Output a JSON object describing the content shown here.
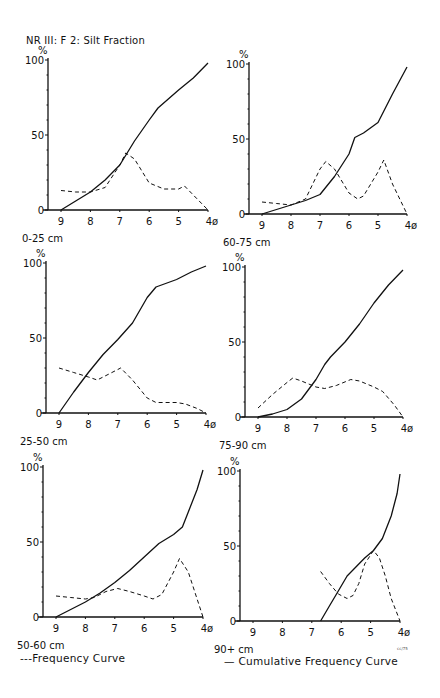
{
  "figure": {
    "title": "NR III: F 2: Silt Fraction",
    "legend": {
      "frequency": "---Frequency Curve",
      "cumulative": "— Cumulative Frequency Curve"
    },
    "corner_mark": "cc/75"
  },
  "chart_data": [
    {
      "type": "line",
      "title": "0-25 cm",
      "xlabel": "φ",
      "ylabel": "%",
      "x_ticks": [
        "9",
        "8",
        "7",
        "6",
        "5",
        "4ø"
      ],
      "y_ticks": [
        "0",
        "50",
        "100"
      ],
      "xlim": [
        9.4,
        4
      ],
      "ylim": [
        0,
        100
      ],
      "series": [
        {
          "name": "Cumulative Frequency Curve",
          "style": "solid",
          "x": [
            9,
            8.5,
            8,
            7.5,
            7,
            6.5,
            6,
            5.7,
            5,
            4.5,
            4
          ],
          "y": [
            0,
            6,
            12,
            20,
            30,
            46,
            60,
            68,
            80,
            88,
            98
          ]
        },
        {
          "name": "Frequency Curve",
          "style": "dashed",
          "x": [
            9,
            8.5,
            8,
            7.5,
            7,
            6.8,
            6.5,
            6,
            5.5,
            5,
            4.8,
            4.5,
            4
          ],
          "y": [
            13,
            12,
            12,
            15,
            30,
            38,
            34,
            18,
            14,
            14,
            16,
            10,
            0
          ]
        }
      ]
    },
    {
      "type": "line",
      "title": "60-75 cm",
      "xlabel": "φ",
      "ylabel": "%",
      "x_ticks": [
        "9",
        "8",
        "7",
        "6",
        "5",
        "4ø"
      ],
      "y_ticks": [
        "0",
        "50",
        "100"
      ],
      "xlim": [
        9.4,
        4
      ],
      "ylim": [
        0,
        100
      ],
      "series": [
        {
          "name": "Cumulative Frequency Curve",
          "style": "solid",
          "x": [
            9,
            8.5,
            8,
            7.5,
            7,
            6.5,
            6,
            5.8,
            5.5,
            5,
            4.5,
            4
          ],
          "y": [
            0,
            3,
            6,
            9,
            13,
            25,
            40,
            51,
            54,
            61,
            80,
            98
          ]
        },
        {
          "name": "Frequency Curve",
          "style": "dashed",
          "x": [
            9,
            8.5,
            8,
            7.5,
            7,
            6.8,
            6.5,
            6,
            5.7,
            5.5,
            5,
            4.8,
            4.5,
            4
          ],
          "y": [
            8,
            7,
            6,
            10,
            30,
            35,
            30,
            14,
            10,
            12,
            28,
            36,
            20,
            0
          ]
        }
      ]
    },
    {
      "type": "line",
      "title": "25-50 cm",
      "xlabel": "φ",
      "ylabel": "%",
      "x_ticks": [
        "9",
        "8",
        "7",
        "6",
        "5",
        "4ø"
      ],
      "y_ticks": [
        "0",
        "50",
        "100"
      ],
      "xlim": [
        9.4,
        4
      ],
      "ylim": [
        0,
        100
      ],
      "series": [
        {
          "name": "Cumulative Frequency Curve",
          "style": "solid",
          "x": [
            9,
            8.5,
            8,
            7.5,
            7,
            6.5,
            6,
            5.7,
            5,
            4.5,
            4
          ],
          "y": [
            0,
            14,
            27,
            39,
            49,
            60,
            77,
            84,
            89,
            94,
            98
          ]
        },
        {
          "name": "Frequency Curve",
          "style": "dashed",
          "x": [
            9,
            8.5,
            8,
            7.7,
            7.3,
            6.9,
            6.5,
            6,
            5.7,
            5,
            4.7,
            4.3,
            4
          ],
          "y": [
            30,
            27,
            24,
            22,
            26,
            30,
            22,
            10,
            7,
            7,
            6,
            3,
            0
          ]
        }
      ]
    },
    {
      "type": "line",
      "title": "75-90 cm",
      "xlabel": "φ",
      "ylabel": "%",
      "x_ticks": [
        "9",
        "8",
        "7",
        "6",
        "5",
        "4ø"
      ],
      "y_ticks": [
        "0",
        "50",
        "100"
      ],
      "xlim": [
        9.4,
        4
      ],
      "ylim": [
        0,
        100
      ],
      "series": [
        {
          "name": "Cumulative Frequency Curve",
          "style": "solid",
          "x": [
            9,
            8.5,
            8,
            7.5,
            7,
            6.7,
            6.5,
            6,
            5.5,
            5,
            4.5,
            4
          ],
          "y": [
            0,
            2,
            5,
            12,
            25,
            35,
            40,
            50,
            62,
            76,
            88,
            98
          ]
        },
        {
          "name": "Frequency Curve",
          "style": "dashed",
          "x": [
            9,
            8.5,
            8,
            7.8,
            7.5,
            7,
            6.7,
            6.3,
            5.8,
            5.5,
            5,
            4.7,
            4.3,
            4
          ],
          "y": [
            6,
            15,
            23,
            26,
            24,
            20,
            19,
            21,
            25,
            24,
            20,
            17,
            8,
            0
          ]
        }
      ]
    },
    {
      "type": "line",
      "title": "50-60 cm",
      "xlabel": "φ",
      "ylabel": "%",
      "x_ticks": [
        "9",
        "8",
        "7",
        "6",
        "5",
        "4ø"
      ],
      "y_ticks": [
        "0",
        "50",
        "100"
      ],
      "xlim": [
        9.4,
        4
      ],
      "ylim": [
        0,
        100
      ],
      "series": [
        {
          "name": "Cumulative Frequency Curve",
          "style": "solid",
          "x": [
            9,
            8.5,
            8,
            7.5,
            7,
            6.5,
            6,
            5.5,
            5,
            4.7,
            4.5,
            4.2,
            4
          ],
          "y": [
            0,
            5,
            10,
            16,
            23,
            31,
            40,
            49,
            55,
            60,
            70,
            85,
            98
          ]
        },
        {
          "name": "Frequency Curve",
          "style": "dashed",
          "x": [
            9,
            8.5,
            8,
            7.7,
            7.3,
            6.9,
            6.5,
            6,
            5.7,
            5.4,
            5,
            4.8,
            4.5,
            4.2,
            4
          ],
          "y": [
            14,
            13,
            12,
            13,
            17,
            19,
            17,
            14,
            12,
            15,
            30,
            39,
            30,
            12,
            0
          ]
        }
      ]
    },
    {
      "type": "line",
      "title": "90+ cm",
      "xlabel": "φ",
      "ylabel": "%",
      "x_ticks": [
        "9",
        "8",
        "7",
        "6",
        "5",
        "4ø"
      ],
      "y_ticks": [
        "0",
        "50",
        "100"
      ],
      "xlim": [
        9.4,
        4
      ],
      "ylim": [
        0,
        100
      ],
      "series": [
        {
          "name": "Cumulative Frequency Curve",
          "style": "solid",
          "x": [
            6.7,
            6.4,
            6.1,
            5.8,
            5.5,
            5.2,
            4.9,
            4.6,
            4.3,
            4.1,
            4
          ],
          "y": [
            0,
            10,
            20,
            30,
            36,
            42,
            47,
            55,
            70,
            85,
            98
          ]
        },
        {
          "name": "Frequency Curve",
          "style": "dashed",
          "x": [
            6.7,
            6.4,
            6.1,
            5.8,
            5.6,
            5.4,
            5.2,
            4.9,
            4.7,
            4.5,
            4.3,
            4
          ],
          "y": [
            33,
            25,
            18,
            15,
            17,
            25,
            38,
            47,
            42,
            30,
            15,
            0
          ]
        }
      ]
    }
  ]
}
